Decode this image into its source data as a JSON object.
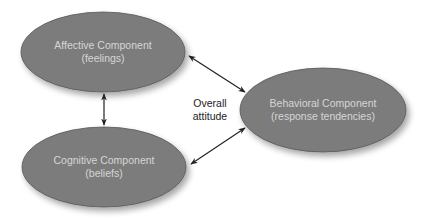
{
  "diagram": {
    "type": "tripartite-attitude-model",
    "colors": {
      "background": "#ffffff",
      "ellipse_fill": "#7c7c7c",
      "ellipse_stroke": "#555555",
      "node_text": "#d6d6d6",
      "arrow": "#222222",
      "center_text": "#222222"
    },
    "nodes": [
      {
        "id": "affective",
        "title": "Affective Component",
        "subtitle": "(feelings)"
      },
      {
        "id": "cognitive",
        "title": "Cognitive Component",
        "subtitle": "(beliefs)"
      },
      {
        "id": "behavioral",
        "title": "Behavioral Component",
        "subtitle": "(response tendencies)"
      }
    ],
    "center_label": {
      "line1": "Overall",
      "line2": "attitude"
    },
    "edges": [
      {
        "from": "affective",
        "to": "cognitive",
        "direction": "bidirectional"
      },
      {
        "from": "affective",
        "to": "behavioral",
        "direction": "bidirectional"
      },
      {
        "from": "cognitive",
        "to": "behavioral",
        "direction": "bidirectional"
      }
    ]
  }
}
